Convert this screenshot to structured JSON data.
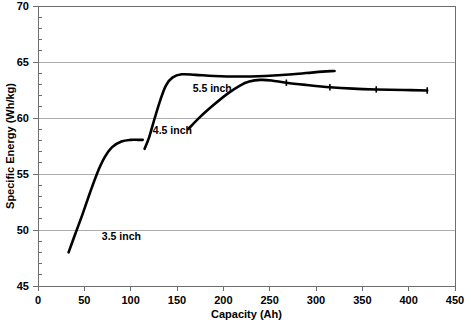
{
  "chart_data": {
    "type": "line",
    "title": "",
    "xlabel": "Capacity (Ah)",
    "ylabel": "Specific Energy (Wh/kg)",
    "xlim": [
      0,
      450
    ],
    "ylim": [
      45,
      70
    ],
    "xticks": [
      0,
      50,
      100,
      150,
      200,
      250,
      300,
      350,
      400,
      450
    ],
    "xtick_labels": [
      "0",
      "50",
      "100",
      "150",
      "200",
      "250",
      "300",
      "350",
      "400",
      "450"
    ],
    "yticks": [
      45,
      50,
      55,
      60,
      65,
      70
    ],
    "ytick_labels": [
      "45",
      "50",
      "55",
      "60",
      "65",
      "70"
    ],
    "grid": "horizontal",
    "legend_position": "inline-annotations",
    "line_color": "#000000",
    "grid_color": "#9a9a9a",
    "axis_color": "#6d6d6d",
    "background": "#ffffff",
    "series": [
      {
        "name": "3.5 inch",
        "label": "3.5 inch",
        "label_x": 90,
        "label_y": 49.1,
        "x": [
          33,
          40,
          48,
          56,
          64,
          72,
          80,
          90,
          100,
          108,
          113
        ],
        "y": [
          48.0,
          49.6,
          51.4,
          53.3,
          55.1,
          56.5,
          57.4,
          57.9,
          58.05,
          58.05,
          58.05
        ]
      },
      {
        "name": "4.5 inch",
        "label": "4.5 inch",
        "label_x": 145,
        "label_y": 58.6,
        "x": [
          115,
          120,
          126,
          132,
          138,
          145,
          155,
          170,
          190,
          215,
          245,
          275,
          300,
          320
        ],
        "y": [
          57.25,
          58.3,
          60.0,
          61.6,
          62.9,
          63.6,
          63.9,
          63.85,
          63.75,
          63.7,
          63.75,
          63.9,
          64.1,
          64.2
        ]
      },
      {
        "name": "5.5 inch",
        "label": "5.5 inch",
        "label_x": 188,
        "label_y": 62.3,
        "x": [
          162,
          175,
          190,
          205,
          218,
          228,
          240,
          252,
          268,
          290,
          315,
          340,
          365,
          395,
          420
        ],
        "y": [
          59.0,
          60.1,
          61.2,
          62.2,
          62.9,
          63.25,
          63.4,
          63.35,
          63.15,
          62.95,
          62.75,
          62.62,
          62.55,
          62.5,
          62.45
        ]
      }
    ],
    "markers": {
      "5.5 inch": [
        {
          "x": 268,
          "y": 63.15
        },
        {
          "x": 315,
          "y": 62.75
        },
        {
          "x": 365,
          "y": 62.55
        },
        {
          "x": 420,
          "y": 62.45
        }
      ]
    }
  }
}
